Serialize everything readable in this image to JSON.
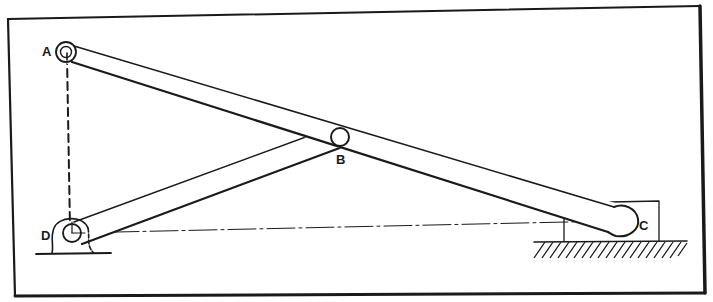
{
  "diagram": {
    "type": "mechanism-linkage",
    "colors": {
      "ink": "#1a1a1a",
      "background": "#ffffff"
    },
    "points": {
      "A": {
        "label": "A",
        "x": 66,
        "y": 52
      },
      "B": {
        "label": "B",
        "x": 340,
        "y": 137
      },
      "C": {
        "label": "C",
        "x": 622,
        "y": 222
      },
      "D": {
        "label": "D",
        "x": 72,
        "y": 233
      }
    },
    "links": [
      {
        "name": "link-AC",
        "from": "A",
        "to": "C"
      },
      {
        "name": "link-DB",
        "from": "D",
        "to": "B"
      }
    ],
    "construction_lines": [
      {
        "name": "dashed-AD",
        "from": "A",
        "to": "D",
        "style": "dashed"
      },
      {
        "name": "centerline-DC",
        "from": "D",
        "to": "C",
        "style": "dash-dot"
      }
    ],
    "supports": [
      {
        "name": "pivot-bracket-D",
        "at": "D"
      },
      {
        "name": "slider-block-C",
        "at": "C"
      },
      {
        "name": "ground-hatch",
        "at": "C"
      }
    ]
  }
}
